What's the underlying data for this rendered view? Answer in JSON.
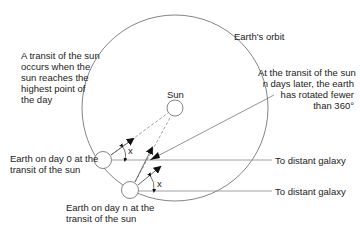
{
  "diagram": {
    "labels": {
      "orbit": "Earth's orbit",
      "transit_definition": [
        "A transit of the sun",
        "occurs when the",
        "sun reaches the",
        "highest point of",
        "the day"
      ],
      "transit_n_days": [
        "At the transit of the sun",
        "n days later, the earth",
        "has rotated fewer",
        "than 360°"
      ],
      "sun": "Sun",
      "earth_day0": [
        "Earth on day 0 at the",
        "transit of the sun"
      ],
      "earth_dayn": [
        "Earth on day n at the",
        "transit of the sun"
      ],
      "galaxy_1": "To distant galaxy",
      "galaxy_2": "To distant galaxy",
      "angle_1": "x",
      "angle_2": "x"
    },
    "colors": {
      "line": "#555555",
      "text": "#222222"
    }
  }
}
